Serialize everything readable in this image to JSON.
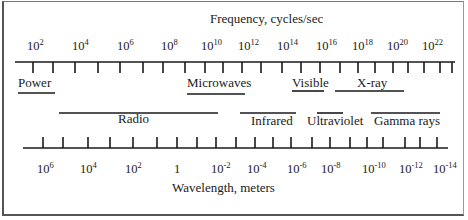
{
  "diagram": {
    "title_top": "Frequency, cycles/sec",
    "title_bottom": "Wavelength, meters",
    "frequency_axis": {
      "y": 62,
      "x_start": 15,
      "x_end": 455,
      "ticks_x": [
        33,
        53,
        75,
        98,
        120,
        143,
        163,
        185,
        205,
        223,
        242,
        261,
        282,
        301,
        320,
        340,
        358,
        375,
        393,
        408,
        424,
        440,
        452
      ],
      "labels": [
        {
          "base": "10",
          "exp": "2",
          "x": 27
        },
        {
          "base": "10",
          "exp": "4",
          "x": 72
        },
        {
          "base": "10",
          "exp": "6",
          "x": 117
        },
        {
          "base": "10",
          "exp": "8",
          "x": 161
        },
        {
          "base": "10",
          "exp": "10",
          "x": 201
        },
        {
          "base": "10",
          "exp": "12",
          "x": 238
        },
        {
          "base": "10",
          "exp": "14",
          "x": 277
        },
        {
          "base": "10",
          "exp": "16",
          "x": 316
        },
        {
          "base": "10",
          "exp": "18",
          "x": 352
        },
        {
          "base": "10",
          "exp": "20",
          "x": 387
        },
        {
          "base": "10",
          "exp": "22",
          "x": 422
        }
      ]
    },
    "wavelength_axis": {
      "y": 148,
      "x_start": 23,
      "x_end": 448,
      "ticks_x": [
        43,
        63,
        88,
        110,
        133,
        157,
        177,
        197,
        216,
        236,
        255,
        273,
        291,
        312,
        330,
        350,
        367,
        383,
        405,
        420,
        437
      ],
      "labels": [
        {
          "base": "10",
          "exp": "6",
          "x": 37
        },
        {
          "base": "10",
          "exp": "4",
          "x": 80
        },
        {
          "base": "10",
          "exp": "2",
          "x": 125
        },
        {
          "base": "1",
          "exp": "",
          "x": 174
        },
        {
          "base": "10",
          "exp": "-2",
          "x": 211
        },
        {
          "base": "10",
          "exp": "-4",
          "x": 247
        },
        {
          "base": "10",
          "exp": "-6",
          "x": 287
        },
        {
          "base": "10",
          "exp": "-8",
          "x": 321
        },
        {
          "base": "10",
          "exp": "-10",
          "x": 362
        },
        {
          "base": "10",
          "exp": "-12",
          "x": 399
        },
        {
          "base": "10",
          "exp": "-14",
          "x": 433
        }
      ]
    },
    "bands_top": [
      {
        "name": "Power",
        "label_x": 18,
        "label_y": 87,
        "bar_x1": 18,
        "bar_x2": 55,
        "bar_y": 93
      },
      {
        "name": "Microwaves",
        "label_x": 187,
        "label_y": 87,
        "bar_x1": 187,
        "bar_x2": 245,
        "bar_y": 94
      },
      {
        "name": "Visible",
        "label_x": 292,
        "label_y": 87,
        "bar_x1": 292,
        "bar_x2": 324,
        "bar_y": 91
      },
      {
        "name": "X-ray",
        "label_x": 357,
        "label_y": 87,
        "bar_x1": 335,
        "bar_x2": 404,
        "bar_y": 91
      }
    ],
    "bands_bottom": [
      {
        "name": "Radio",
        "label_x": 118,
        "label_y": 123,
        "bar_x1": 59,
        "bar_x2": 218,
        "bar_y": 113
      },
      {
        "name": "Infrared",
        "label_x": 251,
        "label_y": 125,
        "bar_x1": 240,
        "bar_x2": 296,
        "bar_y": 113
      },
      {
        "name": "Ultraviolet",
        "label_x": 307,
        "label_y": 125,
        "bar_x1": 317,
        "bar_x2": 343,
        "bar_y": 113
      },
      {
        "name": "Gamma rays",
        "label_x": 374,
        "label_y": 125,
        "bar_x1": 371,
        "bar_x2": 440,
        "bar_y": 113
      }
    ]
  }
}
